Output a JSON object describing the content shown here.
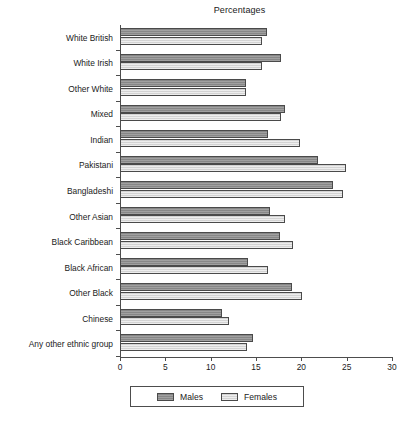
{
  "chart_data": {
    "type": "bar",
    "orientation": "horizontal",
    "title": "Percentages",
    "xlabel": "",
    "ylabel": "",
    "xlim": [
      0,
      30
    ],
    "xticks": [
      0,
      5,
      10,
      15,
      20,
      25,
      30
    ],
    "xtick_labels": [
      "0",
      "5",
      "10",
      "15",
      "20",
      "25",
      "30"
    ],
    "grid": false,
    "legend_position": "bottom",
    "categories": [
      "White British",
      "White Irish",
      "Other White",
      "Mixed",
      "Indian",
      "Pakistani",
      "Bangladeshi",
      "Other Asian",
      "Black Caribbean",
      "Black African",
      "Other Black",
      "Chinese",
      "Any other ethnic group"
    ],
    "series": [
      {
        "name": "Males",
        "color": "#8e8e8e",
        "values": [
          16.2,
          17.8,
          13.9,
          18.2,
          16.3,
          21.8,
          23.5,
          16.5,
          17.6,
          14.1,
          19.0,
          11.3,
          14.7
        ]
      },
      {
        "name": "Females",
        "color": "#dcdcdc",
        "values": [
          15.7,
          15.7,
          13.9,
          17.8,
          19.9,
          24.9,
          24.6,
          18.2,
          19.1,
          16.3,
          20.1,
          12.0,
          14.0
        ]
      }
    ]
  },
  "legend": {
    "entries": [
      {
        "label": "Males",
        "swatch": "males-swatch"
      },
      {
        "label": "Females",
        "swatch": "females-swatch"
      }
    ]
  }
}
